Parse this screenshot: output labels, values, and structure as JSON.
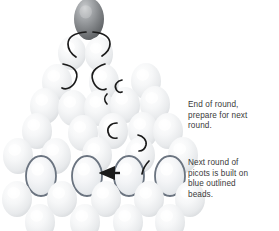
{
  "diagram": {
    "background_color": "#ffffff",
    "bead_fill_light": "#f4f5f6",
    "bead_fill_shadow": "#dcdee0",
    "bead_highlight": "#ffffff",
    "top_bead_fill": "#8d8f92",
    "top_bead_shadow": "#5f6164",
    "outline_bead_stroke": "#6b7480",
    "thread_color": "#1a1a1a",
    "arrow_color": "#1a1a1a",
    "text_color": "#3a3a3a",
    "outlined_bead_count": 4,
    "beads": [
      {
        "id": "top-bead",
        "cx": 89,
        "cy": 19,
        "rx": 15,
        "ry": 21,
        "style": "dark"
      },
      {
        "id": "bead-r1-1",
        "cx": 72,
        "cy": 53,
        "rx": 14,
        "ry": 17,
        "style": "light"
      },
      {
        "id": "bead-r1-2",
        "cx": 99,
        "cy": 54,
        "rx": 14,
        "ry": 17,
        "style": "light"
      },
      {
        "id": "bead-r2-1",
        "cx": 57,
        "cy": 82,
        "rx": 15,
        "ry": 18,
        "style": "light"
      },
      {
        "id": "bead-r2-2",
        "cx": 104,
        "cy": 82,
        "rx": 15,
        "ry": 18,
        "style": "light"
      },
      {
        "id": "bead-r2-3",
        "cx": 146,
        "cy": 81,
        "rx": 15,
        "ry": 18,
        "style": "light"
      },
      {
        "id": "bead-r3-1",
        "cx": 45,
        "cy": 106,
        "rx": 15,
        "ry": 18,
        "style": "light"
      },
      {
        "id": "bead-r3-2",
        "cx": 73,
        "cy": 108,
        "rx": 15,
        "ry": 18,
        "style": "light"
      },
      {
        "id": "bead-r3-3",
        "cx": 99,
        "cy": 108,
        "rx": 15,
        "ry": 18,
        "style": "light"
      },
      {
        "id": "bead-r3-4",
        "cx": 125,
        "cy": 105,
        "rx": 15,
        "ry": 18,
        "style": "light"
      },
      {
        "id": "bead-r3-5",
        "cx": 155,
        "cy": 104,
        "rx": 15,
        "ry": 18,
        "style": "light"
      },
      {
        "id": "bead-r4-1",
        "cx": 37,
        "cy": 131,
        "rx": 15,
        "ry": 18,
        "style": "light"
      },
      {
        "id": "bead-r4-2",
        "cx": 83,
        "cy": 133,
        "rx": 15,
        "ry": 18,
        "style": "light"
      },
      {
        "id": "bead-r4-3",
        "cx": 113,
        "cy": 131,
        "rx": 15,
        "ry": 18,
        "style": "light"
      },
      {
        "id": "bead-r4-4",
        "cx": 143,
        "cy": 130,
        "rx": 15,
        "ry": 18,
        "style": "light"
      },
      {
        "id": "bead-r4-5",
        "cx": 168,
        "cy": 131,
        "rx": 15,
        "ry": 18,
        "style": "light"
      },
      {
        "id": "bead-r5-1",
        "cx": 18,
        "cy": 156,
        "rx": 15,
        "ry": 18,
        "style": "light"
      },
      {
        "id": "bead-r5-2",
        "cx": 56,
        "cy": 156,
        "rx": 15,
        "ry": 18,
        "style": "light"
      },
      {
        "id": "bead-r5-3",
        "cx": 97,
        "cy": 155,
        "rx": 15,
        "ry": 18,
        "style": "light"
      },
      {
        "id": "bead-r5-4",
        "cx": 140,
        "cy": 155,
        "rx": 15,
        "ry": 18,
        "style": "light"
      },
      {
        "id": "bead-r5-5",
        "cx": 183,
        "cy": 155,
        "rx": 15,
        "ry": 18,
        "style": "light"
      },
      {
        "id": "bead-outlined-1",
        "cx": 41,
        "cy": 176,
        "rx": 15,
        "ry": 20,
        "style": "outlined"
      },
      {
        "id": "bead-outlined-2",
        "cx": 87,
        "cy": 176,
        "rx": 15,
        "ry": 20,
        "style": "outlined"
      },
      {
        "id": "bead-outlined-3",
        "cx": 129,
        "cy": 176,
        "rx": 15,
        "ry": 20,
        "style": "outlined"
      },
      {
        "id": "bead-outlined-4",
        "cx": 170,
        "cy": 176,
        "rx": 15,
        "ry": 20,
        "style": "outlined"
      },
      {
        "id": "bead-r6-1",
        "cx": 17,
        "cy": 199,
        "rx": 15,
        "ry": 18,
        "style": "light"
      },
      {
        "id": "bead-r6-2",
        "cx": 62,
        "cy": 199,
        "rx": 15,
        "ry": 18,
        "style": "light"
      },
      {
        "id": "bead-r6-3",
        "cx": 106,
        "cy": 199,
        "rx": 15,
        "ry": 18,
        "style": "light"
      },
      {
        "id": "bead-r6-4",
        "cx": 149,
        "cy": 199,
        "rx": 15,
        "ry": 18,
        "style": "light"
      },
      {
        "id": "bead-r6-5",
        "cx": 190,
        "cy": 199,
        "rx": 15,
        "ry": 18,
        "style": "light"
      },
      {
        "id": "bead-r7-1",
        "cx": 40,
        "cy": 222,
        "rx": 15,
        "ry": 18,
        "style": "light"
      },
      {
        "id": "bead-r7-2",
        "cx": 85,
        "cy": 222,
        "rx": 15,
        "ry": 18,
        "style": "light"
      },
      {
        "id": "bead-r7-3",
        "cx": 128,
        "cy": 222,
        "rx": 15,
        "ry": 18,
        "style": "light"
      },
      {
        "id": "bead-r7-4",
        "cx": 170,
        "cy": 222,
        "rx": 15,
        "ry": 18,
        "style": "light"
      }
    ],
    "threads": [
      {
        "id": "thread-top-left",
        "d": "M 86,32 C 74,33 68,37 68,44 C 68,51 73,55 76,57"
      },
      {
        "id": "thread-top-right",
        "d": "M 93,32 C 105,33 110,37 110,44 C 110,50 105,54 102,56"
      },
      {
        "id": "thread-mid-left",
        "d": "M 63,64 C 74,66 79,72 76,80 C 73,88 66,90 62,88"
      },
      {
        "id": "thread-mid-right",
        "d": "M 105,64 C 95,67 90,73 93,81 C 96,89 102,91 106,89"
      },
      {
        "id": "thread-small-1",
        "d": "M 122,80 C 117,81 114,85 116,89 C 117,92 120,93 122,92"
      },
      {
        "id": "thread-small-2",
        "d": "M 107,94 C 104,97 104,101 107,104"
      },
      {
        "id": "thread-small-3",
        "d": "M 117,123 C 111,123 107,127 108,132 C 109,137 113,139 117,138"
      },
      {
        "id": "thread-small-4",
        "d": "M 138,135 C 143,136 147,140 146,145 C 145,149 142,151 139,151"
      },
      {
        "id": "thread-small-5",
        "d": "M 149,161 C 145,165 143,169 142,174"
      }
    ],
    "arrow": {
      "id": "picot-direction-arrow",
      "from_x": 120,
      "from_y": 173,
      "to_x": 101,
      "to_y": 173,
      "label": "arrow pointing left"
    }
  },
  "annotations": {
    "end_of_round": "End of round,\nprepare for next\nround.",
    "next_round": "Next round of\npicots is built on\nblue outlined\nbeads."
  }
}
